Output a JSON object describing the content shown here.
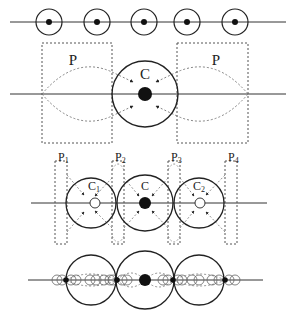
{
  "diagram": {
    "panels": [
      {
        "id": "panel-1",
        "description": "Five identical small circles with center dots along a horizontal line"
      },
      {
        "id": "panel-2",
        "labels": {
          "left_box": "P",
          "right_box": "P",
          "center_circle": "C"
        }
      },
      {
        "id": "panel-3",
        "labels": {
          "boxes": [
            {
              "main": "P",
              "sub": "1"
            },
            {
              "main": "P",
              "sub": "2"
            },
            {
              "main": "P",
              "sub": "3"
            },
            {
              "main": "P",
              "sub": "4"
            }
          ],
          "circles": [
            {
              "main": "C",
              "sub": "1"
            },
            {
              "main": "C",
              "sub": ""
            },
            {
              "main": "C",
              "sub": "2"
            }
          ]
        }
      },
      {
        "id": "panel-4",
        "description": "Three large circles with many small overlapping circles along the line"
      }
    ],
    "colors": {
      "stroke": "#222222",
      "dotted": "#555555",
      "background": "#ffffff"
    }
  }
}
